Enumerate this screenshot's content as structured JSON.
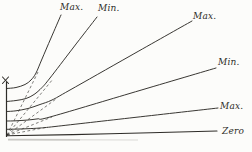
{
  "figure": {
    "name": "hand-drawn characteristic curves figure",
    "background": "#fcfcfa",
    "ink": "#2e2c28",
    "width": 252,
    "height": 152
  },
  "chart_data": {
    "type": "line",
    "title": "",
    "xlabel": "",
    "ylabel": "",
    "grid": false,
    "legend": "labels at line ends",
    "axis": {
      "vertical": [
        [
          6.5,
          82
        ],
        [
          6.5,
          136.5
        ]
      ],
      "origin_mark": "x",
      "origin_mark_strokes": [
        [
          [
            2.5,
            77
          ],
          [
            8.5,
            83.5
          ]
        ],
        [
          [
            8.5,
            77
          ],
          [
            2.5,
            83.5
          ]
        ]
      ]
    },
    "series": [
      {
        "name": "max-upper-left",
        "label": "Max.",
        "line_style": "solid",
        "label_pos": [
          60,
          2
        ],
        "points": [
          [
            6.5,
            88.5
          ],
          [
            16,
            87.5
          ],
          [
            25,
            84.5
          ],
          [
            31,
            80
          ],
          [
            36,
            73
          ],
          [
            42,
            59
          ],
          [
            51,
            38
          ],
          [
            61,
            15
          ]
        ]
      },
      {
        "name": "min-upper",
        "label": "Min.",
        "line_style": "solid",
        "label_pos": [
          98,
          3
        ],
        "points": [
          [
            6.5,
            101.5
          ],
          [
            16,
            100.5
          ],
          [
            26,
            98.5
          ],
          [
            34,
            94.5
          ],
          [
            42,
            87.5
          ],
          [
            50,
            78
          ],
          [
            73,
            48
          ],
          [
            97,
            17
          ]
        ]
      },
      {
        "name": "max-upper-right",
        "label": "Max.",
        "line_style": "solid",
        "label_pos": [
          193,
          11
        ],
        "points": [
          [
            6.5,
            111.5
          ],
          [
            16,
            110.8
          ],
          [
            28,
            108.5
          ],
          [
            40,
            104.5
          ],
          [
            52,
            100
          ],
          [
            70,
            90
          ],
          [
            130,
            56
          ],
          [
            192,
            21
          ]
        ]
      },
      {
        "name": "min-right",
        "label": "Min.",
        "line_style": "solid",
        "label_pos": [
          218,
          57
        ],
        "points": [
          [
            6.5,
            121
          ],
          [
            16,
            120.8
          ],
          [
            28,
            120
          ],
          [
            38,
            118.8
          ],
          [
            50,
            117
          ],
          [
            130,
            93.4
          ],
          [
            216,
            68
          ]
        ]
      },
      {
        "name": "max-lower-right",
        "label": "Max.",
        "line_style": "solid",
        "label_pos": [
          220,
          101
        ],
        "points": [
          [
            6.5,
            129.3
          ],
          [
            16,
            129.1
          ],
          [
            28,
            128.7
          ],
          [
            40,
            128
          ],
          [
            55,
            126.5
          ],
          [
            135,
            117.4
          ],
          [
            218,
            108
          ]
        ]
      },
      {
        "name": "zero",
        "label": "Zero",
        "line_style": "solid",
        "label_pos": [
          222,
          126
        ],
        "points": [
          [
            6.5,
            135.8
          ],
          [
            110,
            133.8
          ],
          [
            217,
            131
          ]
        ]
      }
    ],
    "tangent_lines": [
      {
        "name": "tangent-to-max-upper-left",
        "line_style": "dashed",
        "points": [
          [
            7,
            135
          ],
          [
            38,
            72
          ]
        ]
      },
      {
        "name": "tangent-to-min-upper",
        "line_style": "dashed",
        "points": [
          [
            7,
            135
          ],
          [
            53,
            79
          ]
        ]
      },
      {
        "name": "tangent-to-max-upper-right",
        "line_style": "dashed",
        "points": [
          [
            7,
            135
          ],
          [
            56,
            99
          ]
        ]
      },
      {
        "name": "tangent-to-min-right",
        "line_style": "dashed",
        "points": [
          [
            7,
            135
          ],
          [
            52,
            117
          ]
        ]
      },
      {
        "name": "tangent-to-max-lower-right",
        "line_style": "dashed",
        "points": [
          [
            7,
            135
          ],
          [
            48,
            127
          ]
        ]
      }
    ],
    "artifact_smudge": {
      "points": [
        [
          8,
          139.6
        ],
        [
          80,
          139.8
        ],
        [
          138,
          139.9
        ]
      ],
      "color": "#9a9892"
    }
  }
}
